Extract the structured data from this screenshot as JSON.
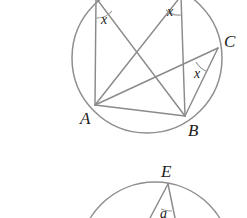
{
  "figure": {
    "background_color": "#ffffff",
    "line_color": "#8a8a8a",
    "circle_color": "#8f8f8f",
    "label_color": "#1c1c1c"
  },
  "diagram_top": {
    "name": "upper-circle-figure",
    "circle": {
      "cx": 147,
      "cy": 58,
      "r": 75
    },
    "points": [
      {
        "id": "A",
        "label": "A",
        "x": 95,
        "y": 105,
        "label_x": 80,
        "label_y": 124
      },
      {
        "id": "B",
        "label": "B",
        "x": 185,
        "y": 116,
        "label_x": 188,
        "label_y": 136
      },
      {
        "id": "C",
        "label": "C",
        "x": 218,
        "y": 48,
        "label_x": 224,
        "label_y": 47
      },
      {
        "id": "D",
        "label": "",
        "x": 96,
        "y": -2,
        "label_x": 0,
        "label_y": 0
      },
      {
        "id": "E",
        "label": "",
        "x": 181,
        "y": -4,
        "label_x": 0,
        "label_y": 0
      }
    ],
    "segments": [
      {
        "from": "D",
        "to": "A"
      },
      {
        "from": "D",
        "to": "B"
      },
      {
        "from": "E",
        "to": "A"
      },
      {
        "from": "E",
        "to": "B"
      },
      {
        "from": "A",
        "to": "B"
      },
      {
        "from": "A",
        "to": "C"
      },
      {
        "from": "B",
        "to": "C"
      }
    ],
    "angles": [
      {
        "id": "angle-at-D",
        "label": "x",
        "label_x": 101,
        "label_y": 24
      },
      {
        "id": "angle-at-E",
        "label": "x",
        "label_x": 167,
        "label_y": 16
      },
      {
        "id": "angle-at-C",
        "label": "x",
        "label_x": 194,
        "label_y": 78
      }
    ]
  },
  "diagram_bottom": {
    "name": "lower-circle-figure",
    "circle": {
      "cx": 155,
      "cy": 258,
      "r": 76
    },
    "points": [
      {
        "id": "E2",
        "label": "E",
        "x": 168,
        "y": 184,
        "label_x": 161,
        "label_y": 177
      }
    ],
    "angles": [
      {
        "id": "angle-at-E2",
        "label": "a",
        "label_x": 160,
        "label_y": 216
      }
    ],
    "segments": [
      {
        "from": "E2",
        "to": "left-ray"
      },
      {
        "from": "E2",
        "to": "right-ray"
      }
    ]
  }
}
